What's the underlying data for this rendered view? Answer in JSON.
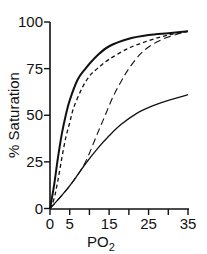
{
  "chart_data": {
    "type": "line",
    "title": "",
    "xlabel": "PO2",
    "xlabel_main": "PO",
    "xlabel_sub": "2",
    "ylabel": "% Saturation",
    "xlim": [
      0,
      35
    ],
    "ylim": [
      0,
      100
    ],
    "x_ticks": [
      0,
      5,
      10,
      15,
      20,
      25,
      30,
      35
    ],
    "x_tick_labels": [
      "0",
      "5",
      "15",
      "25",
      "35"
    ],
    "x_tick_label_values": [
      0,
      5,
      15,
      25,
      35
    ],
    "y_ticks": [
      0,
      25,
      50,
      75,
      100
    ],
    "y_tick_labels": [
      "0",
      "25",
      "50",
      "75",
      "100"
    ],
    "grid": false,
    "legend": null,
    "series": [
      {
        "name": "curve-1-solid-thick",
        "style": "solid",
        "x": [
          0,
          1,
          2,
          3,
          4,
          5,
          7,
          9,
          12,
          15,
          20,
          25,
          30,
          35
        ],
        "values": [
          0,
          12,
          27,
          40,
          50,
          58,
          69,
          75,
          82,
          87,
          91,
          93,
          94,
          95
        ]
      },
      {
        "name": "curve-2-short-dash",
        "style": "short-dash",
        "x": [
          0,
          1,
          2,
          3,
          4,
          5,
          6,
          8,
          10,
          12,
          15,
          20,
          25,
          30,
          35
        ],
        "values": [
          0,
          5,
          15,
          27,
          38,
          46,
          54,
          64,
          71,
          75,
          80,
          86,
          90,
          93,
          95
        ]
      },
      {
        "name": "curve-3-long-dash",
        "style": "long-dash",
        "x": [
          0,
          3,
          6,
          9,
          12,
          14,
          16,
          18,
          20,
          23,
          26,
          30,
          35
        ],
        "values": [
          0,
          7,
          15,
          25,
          40,
          50,
          60,
          68,
          75,
          83,
          88,
          92,
          95
        ]
      },
      {
        "name": "curve-4-solid-thin",
        "style": "solid",
        "x": [
          0,
          3,
          6,
          9,
          12,
          15,
          18,
          22,
          26,
          30,
          35
        ],
        "values": [
          0,
          7,
          15,
          24,
          32,
          39,
          45,
          51,
          55,
          58,
          61
        ]
      }
    ]
  }
}
